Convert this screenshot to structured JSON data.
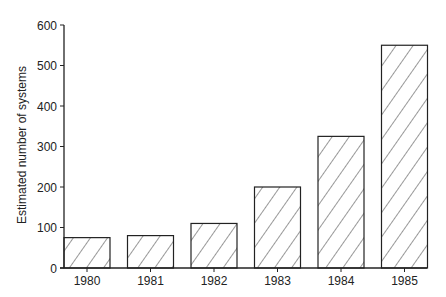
{
  "chart_data": {
    "type": "bar",
    "title": "",
    "xlabel": "",
    "ylabel": "Estimated number of systems",
    "categories": [
      "1980",
      "1981",
      "1982",
      "1983",
      "1984",
      "1985"
    ],
    "values": [
      75,
      80,
      110,
      200,
      325,
      550
    ],
    "ylim": [
      0,
      600
    ],
    "yticks": [
      0,
      100,
      200,
      300,
      400,
      500,
      600
    ],
    "grid": false,
    "legend": null,
    "bar_fill": "diagonal-hatch",
    "colors": {
      "axis": "#222222",
      "bar_stroke": "#222222",
      "hatch": "#333333",
      "background": "#ffffff"
    }
  }
}
